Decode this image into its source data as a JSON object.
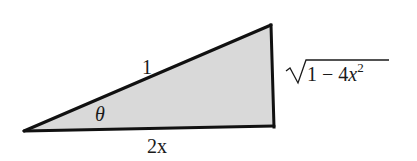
{
  "diagram": {
    "type": "right-triangle",
    "fill_color": "#d9d9d9",
    "stroke_color": "#111111",
    "background_color": "#ffffff",
    "vertices": {
      "acute_angle_vertex": [
        24,
        131
      ],
      "top_right": [
        271,
        25
      ],
      "right_angle_vertex": [
        274,
        126
      ]
    },
    "labels": {
      "hypotenuse": "1",
      "angle": "θ",
      "adjacent_side": "2x",
      "opposite_side": {
        "radical_symbol": "√",
        "radicand_prefix": "1 − 4",
        "variable": "x",
        "exponent": "2"
      }
    }
  }
}
